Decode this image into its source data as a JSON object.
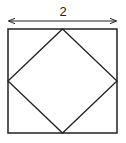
{
  "diagram": {
    "dimension_label": "2",
    "stroke_color": "#222222",
    "background": "#ffffff",
    "outer_square": {
      "x": 8,
      "y": 29,
      "size": 109
    },
    "inner_square_vertices": [
      [
        62.5,
        29
      ],
      [
        117,
        81
      ],
      [
        62.5,
        133
      ],
      [
        8,
        81
      ]
    ],
    "dimension_arrow": {
      "x1": 8,
      "x2": 117,
      "y": 21
    }
  }
}
